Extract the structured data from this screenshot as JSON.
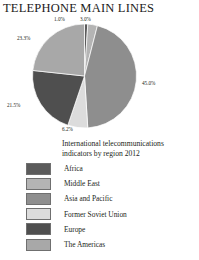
{
  "title": "TELEPHONE MAIN LINES",
  "subtitle": "International telecommunications indicators by region 2012",
  "chart_data": {
    "type": "pie",
    "title": "TELEPHONE MAIN LINES",
    "subtitle": "International telecommunications indicators by region 2012",
    "unit": "percent",
    "legend_position": "bottom",
    "grid": false,
    "categories": [
      "Africa",
      "Middle East",
      "Asia and Pacific",
      "Former Soviet Union",
      "Europe",
      "The Americas"
    ],
    "values": [
      1.0,
      3.0,
      45.0,
      6.2,
      21.5,
      23.3
    ],
    "labels": [
      "1.0%",
      "3.0%",
      "45.0%",
      "6.2%",
      "21.5%",
      "23.3%"
    ],
    "colors": [
      "#5b5b5b",
      "#b4b4b4",
      "#8e8e8e",
      "#dcdcdc",
      "#4f4f4f",
      "#a8a8a8"
    ],
    "slices": [
      {
        "name": "Africa",
        "value": 1.0,
        "label": "1.0%",
        "color": "#5b5b5b",
        "start_angle": 0,
        "end_angle": 3.6
      },
      {
        "name": "Middle East",
        "value": 3.0,
        "label": "3.0%",
        "color": "#b4b4b4",
        "start_angle": 3.6,
        "end_angle": 14.4
      },
      {
        "name": "Asia and Pacific",
        "value": 45.0,
        "label": "45.0%",
        "color": "#8e8e8e",
        "start_angle": 14.4,
        "end_angle": 176.4
      },
      {
        "name": "Former Soviet Union",
        "value": 6.2,
        "label": "6.2%",
        "color": "#dcdcdc",
        "start_angle": 176.4,
        "end_angle": 198.72
      },
      {
        "name": "Europe",
        "value": 21.5,
        "label": "21.5%",
        "color": "#4f4f4f",
        "start_angle": 198.72,
        "end_angle": 276.12
      },
      {
        "name": "The Americas",
        "value": 23.3,
        "label": "23.3%",
        "color": "#a8a8a8",
        "start_angle": 276.12,
        "end_angle": 360
      }
    ]
  },
  "callouts": {
    "africa": "1.0%",
    "middle_east": "3.0%",
    "asia_pacific": "45.0%",
    "former_soviet_union": "6.2%",
    "europe": "21.5%",
    "americas": "23.3%"
  },
  "legend": {
    "items": [
      {
        "label": "Africa",
        "color": "#5b5b5b"
      },
      {
        "label": "Middle East",
        "color": "#b4b4b4"
      },
      {
        "label": "Asia and Pacific",
        "color": "#8e8e8e"
      },
      {
        "label": "Former Soviet Union",
        "color": "#dcdcdc"
      },
      {
        "label": "Europe",
        "color": "#4f4f4f"
      },
      {
        "label": "The Americas",
        "color": "#a8a8a8"
      }
    ]
  }
}
